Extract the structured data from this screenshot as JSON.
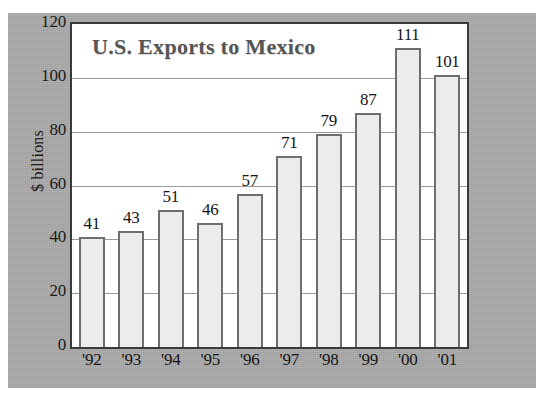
{
  "chart_data": {
    "type": "bar",
    "title": "U.S. Exports to Mexico",
    "xlabel": "",
    "ylabel": "$ billions",
    "categories": [
      "'92",
      "'93",
      "'94",
      "'95",
      "'96",
      "'97",
      "'98",
      "'99",
      "'00",
      "'01"
    ],
    "values": [
      41,
      43,
      51,
      46,
      57,
      71,
      79,
      87,
      111,
      101
    ],
    "value_labels": [
      "41",
      "43",
      "51",
      "46",
      "57",
      "71",
      "79",
      "87",
      "111",
      "101"
    ],
    "ylim": [
      0,
      120
    ],
    "yticks": [
      0,
      20,
      40,
      60,
      80,
      100,
      120
    ],
    "ytick_labels": [
      "0",
      "20",
      "40",
      "60",
      "80",
      "100",
      "120"
    ],
    "grid": "horizontal",
    "legend": null,
    "bar_fill_color": "#ececec",
    "bar_border_color": "#6e6e6e",
    "plot_background": "#ffffff",
    "panel_background": "#a9a9a9",
    "title_color": "#555555",
    "gridline_color": "#9a9a9a",
    "axis_frame_color": "#3a3a3a"
  }
}
